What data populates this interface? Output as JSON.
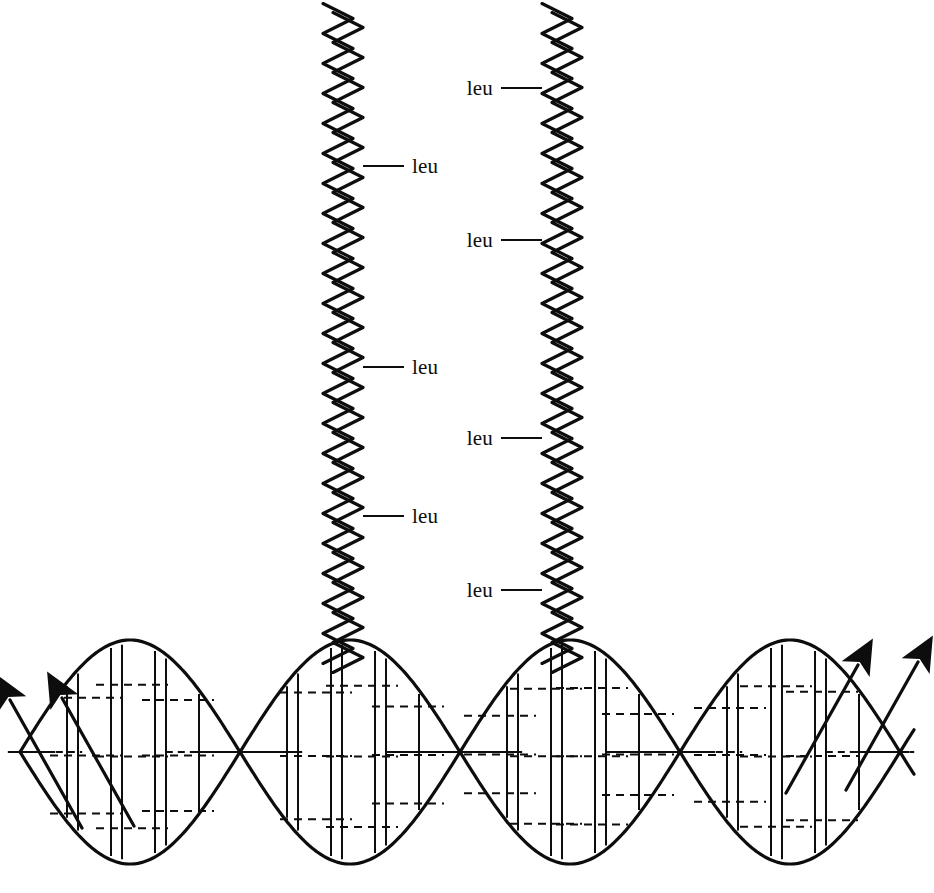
{
  "figure": {
    "background_color": "#ffffff",
    "stroke_color": "#0d0d0d",
    "width": 934,
    "height": 893
  },
  "labels": {
    "leu": "leu"
  },
  "chart_data": {
    "type": "diagram",
    "annotations": [
      "leu",
      "leu",
      "leu",
      "leu",
      "leu",
      "leu",
      "leu"
    ],
    "leucine_label_count": 7
  },
  "helices": [
    {
      "name": "left-alpha-helix",
      "center_x": 343,
      "top_y": 8,
      "bottom_y": 668,
      "amplitude": 15,
      "period": 30,
      "ribbon_offset": 5,
      "labels": [
        {
          "text": "leu",
          "y": 166,
          "side": "right",
          "line_start_x": 363,
          "line_end_x": 404,
          "text_x": 412
        },
        {
          "text": "leu",
          "y": 367,
          "side": "right",
          "line_start_x": 363,
          "line_end_x": 404,
          "text_x": 412
        },
        {
          "text": "leu",
          "y": 516,
          "side": "right",
          "line_start_x": 363,
          "line_end_x": 404,
          "text_x": 412
        }
      ]
    },
    {
      "name": "right-alpha-helix",
      "center_x": 562,
      "top_y": 8,
      "bottom_y": 668,
      "amplitude": 15,
      "period": 30,
      "ribbon_offset": 5,
      "labels": [
        {
          "text": "leu",
          "y": 88,
          "side": "left",
          "line_start_x": 542,
          "line_end_x": 501,
          "text_x": 493
        },
        {
          "text": "leu",
          "y": 240,
          "side": "left",
          "line_start_x": 542,
          "line_end_x": 501,
          "text_x": 493
        },
        {
          "text": "leu",
          "y": 438,
          "side": "left",
          "line_start_x": 542,
          "line_end_x": 501,
          "text_x": 493
        },
        {
          "text": "leu",
          "y": 590,
          "side": "left",
          "line_start_x": 542,
          "line_end_x": 501,
          "text_x": 493
        }
      ]
    }
  ],
  "dna": {
    "name": "dna-double-helix",
    "center_y": 752,
    "amplitude": 112,
    "period": 440,
    "x_start": 20,
    "x_end": 915,
    "phase_offset_px": 220,
    "crossing_points_x": [
      260,
      480,
      700
    ],
    "arrows": [
      {
        "name": "dna-strand-arrow-left-outer",
        "direction": "up-left",
        "tip_x": 10,
        "tip_y": 700
      },
      {
        "name": "dna-strand-arrow-left-inner",
        "direction": "up-left",
        "tip_x": 62,
        "tip_y": 698
      },
      {
        "name": "dna-strand-arrow-right-inner",
        "direction": "up-right",
        "tip_x": 858,
        "tip_y": 665
      },
      {
        "name": "dna-strand-arrow-right-outer",
        "direction": "up-right",
        "tip_x": 918,
        "tip_y": 662
      }
    ]
  }
}
